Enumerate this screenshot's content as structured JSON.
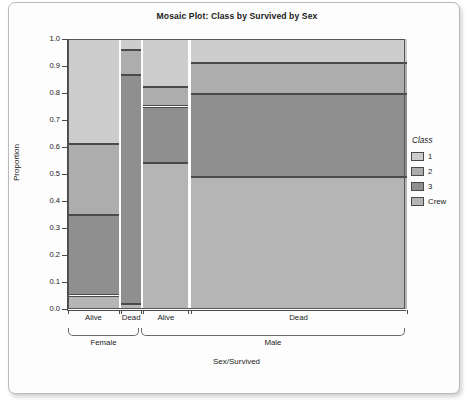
{
  "chart_data": {
    "type": "bar",
    "subtype": "mosaic",
    "title": "Mosaic Plot: Class by Survived by Sex",
    "xlabel": "Sex/Survived",
    "ylabel": "Proportion",
    "ylim": [
      0.0,
      1.0
    ],
    "grid": false,
    "legend_position": "right",
    "legend_title": "Class",
    "y_ticks": [
      "0.0",
      "0.1",
      "0.2",
      "0.3",
      "0.4",
      "0.5",
      "0.6",
      "0.7",
      "0.8",
      "0.9",
      "1.0"
    ],
    "y_tick_values": [
      0.0,
      0.1,
      0.2,
      0.3,
      0.4,
      0.5,
      0.6,
      0.7,
      0.8,
      0.9,
      1.0
    ],
    "categories": [
      "1",
      "2",
      "3",
      "Crew"
    ],
    "colors": {
      "class_1": "#cdcdcd",
      "class_2": "#adadad",
      "class_3": "#8f8f8f",
      "class_crew": "#b5b5b5",
      "outline": "#4a4a4a",
      "background": "#fdfdfd",
      "text": "#1a1a1a"
    },
    "columns": [
      {
        "group": "Female",
        "survived": "Alive",
        "x_label": "Alive",
        "width_fraction": 0.1513,
        "segments": [
          {
            "class": "1",
            "top": 1.0,
            "bottom": 0.61,
            "proportion": 0.39,
            "color_key": "class_1"
          },
          {
            "class": "2",
            "top": 0.61,
            "bottom": 0.347,
            "proportion": 0.263,
            "color_key": "class_2"
          },
          {
            "class": "3",
            "top": 0.347,
            "bottom": 0.05,
            "proportion": 0.297,
            "color_key": "class_3"
          },
          {
            "class": "Crew",
            "top": 0.05,
            "bottom": 0.0,
            "proportion": 0.05,
            "color_key": "class_crew"
          }
        ]
      },
      {
        "group": "Female",
        "survived": "Dead",
        "x_label": "Dead",
        "width_fraction": 0.0593,
        "segments": [
          {
            "class": "1",
            "top": 1.0,
            "bottom": 0.96,
            "proportion": 0.04,
            "color_key": "class_1"
          },
          {
            "class": "2",
            "top": 0.96,
            "bottom": 0.867,
            "proportion": 0.093,
            "color_key": "class_2"
          },
          {
            "class": "3",
            "top": 0.867,
            "bottom": 0.02,
            "proportion": 0.847,
            "color_key": "class_3"
          },
          {
            "class": "Crew",
            "top": 0.02,
            "bottom": 0.0,
            "proportion": 0.02,
            "color_key": "class_crew"
          }
        ]
      },
      {
        "group": "Male",
        "survived": "Alive",
        "x_label": "Alive",
        "width_fraction": 0.1335,
        "segments": [
          {
            "class": "1",
            "top": 1.0,
            "bottom": 0.824,
            "proportion": 0.176,
            "color_key": "class_1"
          },
          {
            "class": "2",
            "top": 0.824,
            "bottom": 0.75,
            "proportion": 0.074,
            "color_key": "class_2"
          },
          {
            "class": "3",
            "top": 0.75,
            "bottom": 0.54,
            "proportion": 0.21,
            "color_key": "class_3"
          },
          {
            "class": "Crew",
            "top": 0.54,
            "bottom": 0.0,
            "proportion": 0.54,
            "color_key": "class_crew"
          }
        ]
      },
      {
        "group": "Male",
        "survived": "Dead",
        "x_label": "Dead",
        "width_fraction": 0.641,
        "segments": [
          {
            "class": "1",
            "top": 1.0,
            "bottom": 0.91,
            "proportion": 0.09,
            "color_key": "class_1"
          },
          {
            "class": "2",
            "top": 0.91,
            "bottom": 0.795,
            "proportion": 0.115,
            "color_key": "class_2"
          },
          {
            "class": "3",
            "top": 0.795,
            "bottom": 0.49,
            "proportion": 0.305,
            "color_key": "class_3"
          },
          {
            "class": "Crew",
            "top": 0.49,
            "bottom": 0.0,
            "proportion": 0.49,
            "color_key": "class_crew"
          }
        ]
      }
    ],
    "groups": [
      {
        "label": "Female",
        "start_fraction": 0.0,
        "end_fraction": 0.2106
      },
      {
        "label": "Male",
        "start_fraction": 0.2165,
        "end_fraction": 1.0
      }
    ],
    "legend_entries": [
      {
        "label": "1",
        "color_key": "class_1"
      },
      {
        "label": "2",
        "color_key": "class_2"
      },
      {
        "label": "3",
        "color_key": "class_3"
      },
      {
        "label": "Crew",
        "color_key": "class_crew"
      }
    ]
  }
}
